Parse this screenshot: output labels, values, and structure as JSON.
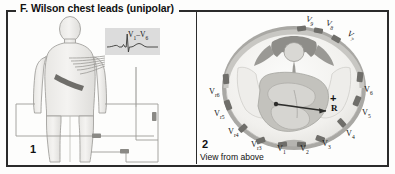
{
  "figure": {
    "section_letter": "F.",
    "title": "Wilson chest leads (unipolar)"
  },
  "panel1": {
    "number": "1",
    "ecg_label_main": "V",
    "ecg_label_sub1": "1",
    "ecg_label_dash": "–V",
    "ecg_label_sub2": "6",
    "ecg_label_full": "V1–V6"
  },
  "panel2": {
    "number": "2",
    "caption": "View from above",
    "center_marker_plus": "+",
    "center_marker_r": "R",
    "leads": [
      {
        "name": "V9",
        "base": "V",
        "sub": "9"
      },
      {
        "name": "V8",
        "base": "V",
        "sub": "8"
      },
      {
        "name": "V7",
        "base": "V",
        "sub": "7"
      },
      {
        "name": "V6",
        "base": "V",
        "sub": "6"
      },
      {
        "name": "V5",
        "base": "V",
        "sub": "5"
      },
      {
        "name": "V4",
        "base": "V",
        "sub": "4"
      },
      {
        "name": "V3",
        "base": "V",
        "sub": "3"
      },
      {
        "name": "V2",
        "base": "V",
        "sub": "2"
      },
      {
        "name": "V1",
        "base": "V",
        "sub": "1"
      },
      {
        "name": "Vr3",
        "base": "V",
        "sub": "r3"
      },
      {
        "name": "Vr4",
        "base": "V",
        "sub": "r4"
      },
      {
        "name": "Vr5",
        "base": "V",
        "sub": "r5"
      },
      {
        "name": "Vr6",
        "base": "V",
        "sub": "r6"
      }
    ]
  },
  "colors": {
    "ink": "#2b2b2b",
    "body_fill": "#f0efed",
    "body_stroke": "#9a9a96",
    "ecg_box": "#dcdcdc",
    "thorax_outer": "#a8a7a3",
    "thorax_fill": "#f2f1ee",
    "bone_dark": "#8d8c88",
    "heart_mid": "#bdbcb7",
    "electrode": "#6e6d69"
  }
}
